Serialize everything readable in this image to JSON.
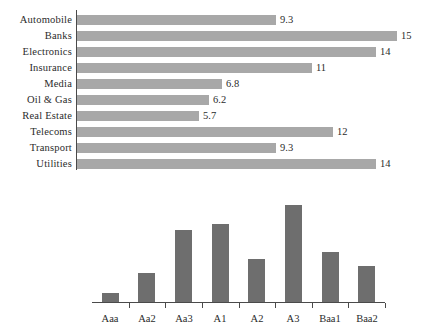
{
  "chart_data": [
    {
      "type": "bar",
      "orientation": "horizontal",
      "title": "",
      "xlabel": "",
      "ylabel": "",
      "categories": [
        "Automobile",
        "Banks",
        "Electronics",
        "Insurance",
        "Media",
        "Oil & Gas",
        "Real Estate",
        "Telecoms",
        "Transport",
        "Utilities"
      ],
      "values": [
        9.3,
        15,
        14,
        11,
        6.8,
        6.2,
        5.7,
        12,
        9.3,
        14
      ],
      "value_labels": [
        "9.3",
        "15",
        "14",
        "11",
        "6.8",
        "6.2",
        "5.7",
        "12",
        "9.3",
        "14"
      ],
      "bar_color": "#a8a8a8",
      "axis_color": "#4a4a4a",
      "grid": false,
      "legend": "none",
      "xlim": [
        0,
        15.5
      ]
    },
    {
      "type": "bar",
      "orientation": "vertical",
      "title": "",
      "xlabel": "",
      "ylabel": "",
      "categories": [
        "Aaa",
        "Aa2",
        "Aa3",
        "A1",
        "A2",
        "A3",
        "Baa1",
        "Baa2"
      ],
      "values": [
        1.0,
        3.2,
        8.0,
        8.6,
        4.7,
        10.7,
        5.5,
        4.0
      ],
      "bar_color": "#6e6e6e",
      "axis_color": "#4a4a4a",
      "grid": false,
      "legend": "none",
      "ylim": [
        0,
        11.5
      ]
    }
  ]
}
